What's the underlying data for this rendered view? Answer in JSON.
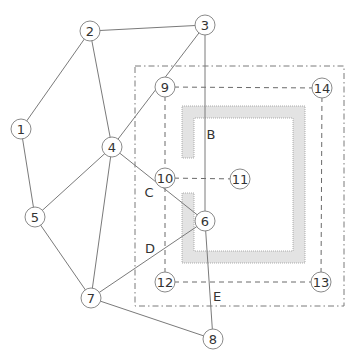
{
  "diagram": {
    "colors": {
      "edge": "#7a7a7a",
      "node_stroke": "#8a8a8a",
      "wall_fill": "#e3e3e3",
      "text": "#333333"
    },
    "nodes": [
      {
        "id": "1",
        "label": "1",
        "x": 21,
        "y": 129
      },
      {
        "id": "2",
        "label": "2",
        "x": 90,
        "y": 31
      },
      {
        "id": "3",
        "label": "3",
        "x": 205,
        "y": 25
      },
      {
        "id": "4",
        "label": "4",
        "x": 112,
        "y": 147
      },
      {
        "id": "5",
        "label": "5",
        "x": 35,
        "y": 217
      },
      {
        "id": "6",
        "label": "6",
        "x": 205,
        "y": 221
      },
      {
        "id": "7",
        "label": "7",
        "x": 91,
        "y": 298
      },
      {
        "id": "8",
        "label": "8",
        "x": 213,
        "y": 339
      },
      {
        "id": "9",
        "label": "9",
        "x": 165,
        "y": 87
      },
      {
        "id": "10",
        "label": "10",
        "x": 165,
        "y": 178
      },
      {
        "id": "11",
        "label": "11",
        "x": 240,
        "y": 179
      },
      {
        "id": "12",
        "label": "12",
        "x": 165,
        "y": 282
      },
      {
        "id": "13",
        "label": "13",
        "x": 321,
        "y": 282
      },
      {
        "id": "14",
        "label": "14",
        "x": 322,
        "y": 88
      }
    ],
    "solid_edges": [
      [
        "1",
        "2"
      ],
      [
        "1",
        "5"
      ],
      [
        "2",
        "3"
      ],
      [
        "2",
        "4"
      ],
      [
        "3",
        "4"
      ],
      [
        "3",
        "6"
      ],
      [
        "4",
        "5"
      ],
      [
        "4",
        "6"
      ],
      [
        "4",
        "7"
      ],
      [
        "5",
        "7"
      ],
      [
        "6",
        "7"
      ],
      [
        "7",
        "8"
      ],
      [
        "6",
        "8"
      ]
    ],
    "dashed_edges": [
      [
        "9",
        "14"
      ],
      [
        "9",
        "10"
      ],
      [
        "10",
        "12"
      ],
      [
        "10",
        "11"
      ],
      [
        "12",
        "13"
      ],
      [
        "14",
        "13"
      ]
    ],
    "region_labels": [
      {
        "id": "B",
        "label": "B",
        "x": 211,
        "y": 134
      },
      {
        "id": "C",
        "label": "C",
        "x": 149,
        "y": 192
      },
      {
        "id": "D",
        "label": "D",
        "x": 150,
        "y": 248
      },
      {
        "id": "E",
        "label": "E",
        "x": 217,
        "y": 296
      }
    ],
    "outer_boundary": {
      "x": 135,
      "y": 66,
      "width": 209,
      "height": 240
    },
    "walls": {
      "outer": {
        "left": 182,
        "top": 106,
        "right": 305,
        "bottom": 263
      },
      "thickness": 12,
      "gap_top_y": 158,
      "gap_bottom_y": 193
    }
  }
}
